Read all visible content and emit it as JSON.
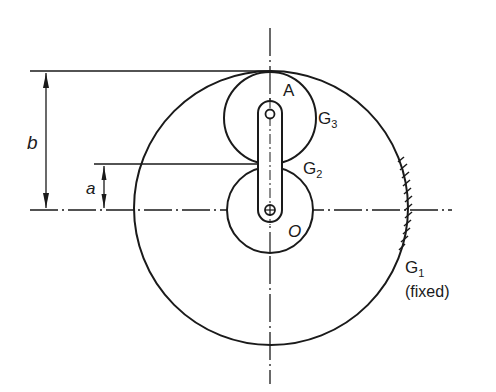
{
  "labels": {
    "A": "A",
    "O": "O",
    "G3": "G",
    "G3_sub": "3",
    "G2": "G",
    "G2_sub": "2",
    "G1": "G",
    "G1_sub": "1",
    "fixed": "(fixed)",
    "a": "a",
    "b": "b"
  },
  "colors": {
    "ink": "#1a1a1a",
    "background": "#ffffff"
  }
}
